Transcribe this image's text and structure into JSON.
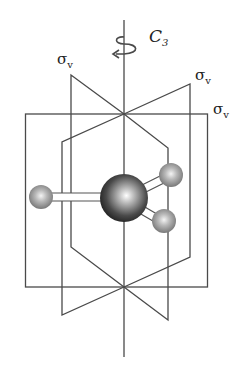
{
  "diagram": {
    "axis_label": {
      "main": "C",
      "sub": "3"
    },
    "plane_labels": [
      {
        "main": "σ",
        "sub": "v"
      },
      {
        "main": "σ",
        "sub": "v"
      },
      {
        "main": "σ",
        "sub": "v"
      }
    ],
    "colors": {
      "line": "#444444",
      "central_atom": "#3a3a3a",
      "outer_atom": "#9a9a9a"
    }
  }
}
